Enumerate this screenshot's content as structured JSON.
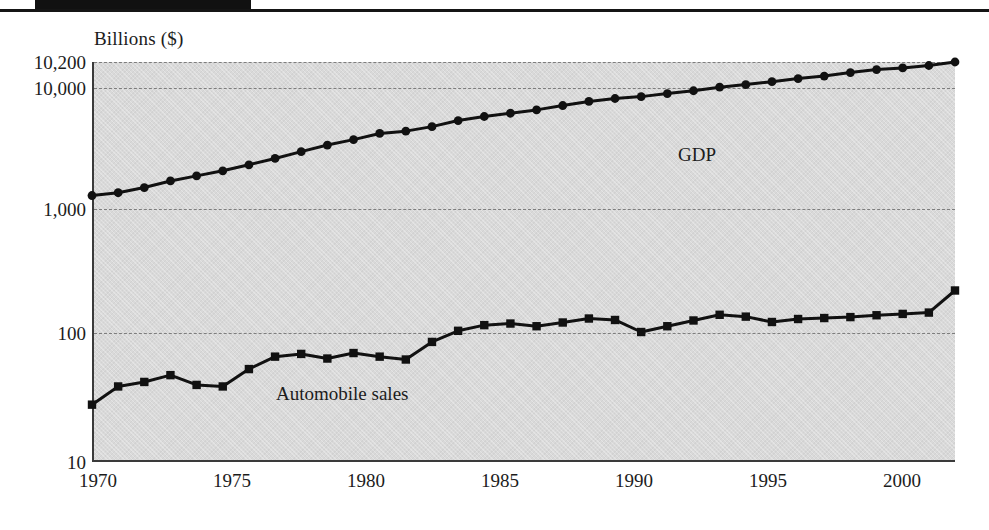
{
  "figure": {
    "y_axis_title": "Billions ($)",
    "gdp_label": "GDP",
    "auto_label": "Automobile sales",
    "plot_bg": "#d9d9d9",
    "line_color": "#111111",
    "grid_color": "#7d7d7d"
  },
  "chart_data": {
    "type": "line",
    "title": "",
    "subtitle": "",
    "xlabel": "",
    "ylabel": "Billions ($)",
    "yscale": "log",
    "ylim": [
      10,
      10200
    ],
    "xlim": [
      1970,
      2003
    ],
    "grid": true,
    "grid_style": "dashed-horizontal",
    "legend": "inline-annotations",
    "ytick_labels": [
      "10,200",
      "10,000",
      "1,000",
      "100",
      "10"
    ],
    "ytick_values": [
      10200,
      10000,
      1000,
      100,
      10
    ],
    "xtick_labels": [
      "1970",
      "1975",
      "1980",
      "1985",
      "1990",
      "1995",
      "2000"
    ],
    "xtick_values": [
      1970,
      1975,
      1980,
      1985,
      1990,
      1995,
      2000
    ],
    "x": [
      1970,
      1971,
      1972,
      1973,
      1974,
      1975,
      1976,
      1977,
      1978,
      1979,
      1980,
      1981,
      1982,
      1983,
      1984,
      1985,
      1986,
      1987,
      1988,
      1989,
      1990,
      1991,
      1992,
      1993,
      1994,
      1995,
      1996,
      1997,
      1998,
      1999,
      2000,
      2001,
      2002,
      2003
    ],
    "series": [
      {
        "name": "GDP",
        "marker": "circle",
        "values": [
          1010,
          1060,
          1160,
          1300,
          1420,
          1550,
          1720,
          1920,
          2160,
          2420,
          2660,
          2960,
          3080,
          3330,
          3700,
          3970,
          4200,
          4450,
          4800,
          5150,
          5420,
          5600,
          5900,
          6200,
          6600,
          6900,
          7250,
          7650,
          8000,
          8500,
          8950,
          9200,
          9600,
          10200
        ]
      },
      {
        "name": "Automobile sales",
        "marker": "square",
        "values": [
          27,
          37,
          40,
          45,
          38,
          37,
          50,
          62,
          65,
          60,
          66,
          62,
          59,
          80,
          97,
          107,
          110,
          105,
          112,
          120,
          117,
          95,
          105,
          116,
          128,
          124,
          113,
          119,
          121,
          123,
          127,
          130,
          133,
          195
        ]
      }
    ],
    "annotations": [
      {
        "text": "GDP",
        "x": 1991.5,
        "y": 1400
      },
      {
        "text": "Automobile sales",
        "x": 1977.0,
        "y": 33
      }
    ]
  },
  "ytick_positions_px": [
    62,
    88,
    209,
    333,
    462
  ],
  "xtick_positions_px": [
    98,
    232,
    366,
    500,
    634,
    768,
    902
  ]
}
